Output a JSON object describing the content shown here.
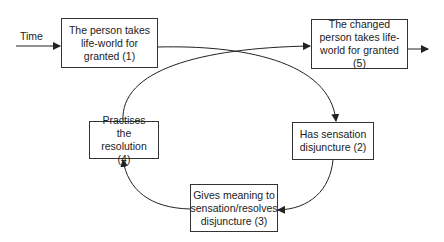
{
  "diagram": {
    "type": "cycle-flow",
    "time_label": "Time",
    "nodes": [
      {
        "id": 1,
        "text": "The person takes life-world for granted (1)"
      },
      {
        "id": 2,
        "text": "Has sensation disjuncture (2)"
      },
      {
        "id": 3,
        "text": "Gives meaning to sensation/resolves disjuncture (3)"
      },
      {
        "id": 4,
        "text": "Practises the resolution (4)"
      },
      {
        "id": 5,
        "text": "The changed person takes life-world for granted (5)"
      }
    ],
    "edges": [
      {
        "from": "Time",
        "to": 1
      },
      {
        "from": 1,
        "to": 2
      },
      {
        "from": 2,
        "to": 3
      },
      {
        "from": 3,
        "to": 4
      },
      {
        "from": 4,
        "to": 5
      },
      {
        "from": 5,
        "to": "out"
      }
    ],
    "colors": {
      "line": "#222222",
      "box_border": "#333333",
      "background": "#ffffff"
    }
  }
}
